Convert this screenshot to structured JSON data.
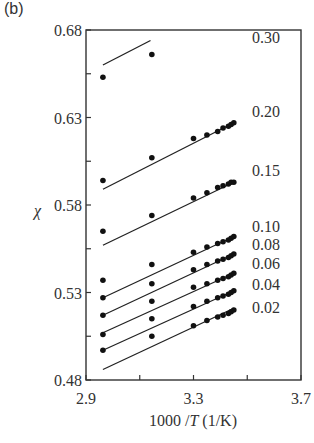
{
  "panel_label": "(b)",
  "chart_data": {
    "type": "scatter",
    "title": "",
    "xlabel": "1000 /T (1/K)",
    "xlabel_parts": {
      "prefix": "1000 /",
      "italic": "T",
      "suffix": " (1/K)"
    },
    "ylabel": "χ",
    "xlim": [
      2.9,
      3.7
    ],
    "ylim": [
      0.48,
      0.68
    ],
    "xticks": [
      2.9,
      3.1,
      3.3,
      3.5,
      3.7
    ],
    "xtick_labels": [
      "2.9",
      "",
      "3.3",
      "",
      "3.7"
    ],
    "yticks": [
      0.48,
      0.505,
      0.53,
      0.555,
      0.58,
      0.605,
      0.63,
      0.655,
      0.68
    ],
    "ytick_labels": [
      "0.48",
      "",
      "0.53",
      "",
      "0.58",
      "",
      "0.63",
      "",
      "0.68"
    ],
    "grid": false,
    "legend_position": "inline-right",
    "x": [
      2.963,
      3.145,
      3.3,
      3.35,
      3.39,
      3.41,
      3.43,
      3.44,
      3.45
    ],
    "series": [
      {
        "name": "0.30",
        "label_y": 0.676,
        "x": [
          2.963,
          3.145
        ],
        "values": [
          0.653,
          0.666
        ],
        "line": [
          [
            2.963,
            0.66
          ],
          [
            3.14,
            0.674
          ]
        ]
      },
      {
        "name": "0.20",
        "label_y": 0.634,
        "values": [
          0.594,
          0.607,
          0.618,
          0.62,
          0.622,
          0.624,
          0.625,
          0.626,
          0.627
        ],
        "line": [
          [
            2.963,
            0.589
          ],
          [
            3.45,
            0.627
          ]
        ]
      },
      {
        "name": "0.15",
        "label_y": 0.6,
        "values": [
          0.565,
          0.574,
          0.584,
          0.587,
          0.59,
          0.591,
          0.592,
          0.593,
          0.593
        ],
        "line": [
          [
            2.963,
            0.557
          ],
          [
            3.45,
            0.593
          ]
        ]
      },
      {
        "name": "0.10",
        "label_y": 0.568,
        "values": [
          0.537,
          0.546,
          0.553,
          0.556,
          0.558,
          0.559,
          0.56,
          0.561,
          0.562
        ],
        "line": [
          [
            2.963,
            0.527
          ],
          [
            3.45,
            0.562
          ]
        ]
      },
      {
        "name": "0.08",
        "label_y": 0.558,
        "values": [
          0.527,
          0.535,
          0.543,
          0.546,
          0.548,
          0.549,
          0.55,
          0.551,
          0.552
        ],
        "line": [
          [
            2.963,
            0.517
          ],
          [
            3.45,
            0.552
          ]
        ]
      },
      {
        "name": "0.06",
        "label_y": 0.547,
        "values": [
          0.517,
          0.525,
          0.533,
          0.535,
          0.537,
          0.538,
          0.539,
          0.54,
          0.541
        ],
        "line": [
          [
            2.963,
            0.507
          ],
          [
            3.45,
            0.541
          ]
        ]
      },
      {
        "name": "0.04",
        "label_y": 0.535,
        "values": [
          0.506,
          0.515,
          0.522,
          0.525,
          0.527,
          0.528,
          0.529,
          0.53,
          0.531
        ],
        "line": [
          [
            2.963,
            0.497
          ],
          [
            3.45,
            0.531
          ]
        ]
      },
      {
        "name": "0.02",
        "label_y": 0.522,
        "values": [
          0.497,
          0.505,
          0.511,
          0.514,
          0.516,
          0.517,
          0.518,
          0.519,
          0.52
        ],
        "line": [
          [
            2.963,
            0.486
          ],
          [
            3.45,
            0.521
          ]
        ]
      }
    ],
    "colors": {
      "axis": "#333333",
      "marker": "#111111",
      "line": "#222222",
      "text": "#333333"
    }
  }
}
